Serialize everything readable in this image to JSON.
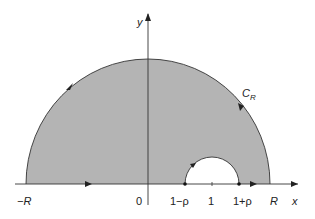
{
  "diagram": {
    "type": "contour",
    "colors": {
      "region_fill": "#b4b4b4",
      "line": "#333333",
      "background": "#ffffff"
    },
    "axes": {
      "x_label": "x",
      "y_label": "y"
    },
    "contour_label": "C",
    "contour_subscript": "R",
    "x_ticks": [
      {
        "label": "−R",
        "italic": true
      },
      {
        "label": "0",
        "italic": false
      },
      {
        "label": "1−ρ",
        "italic": false
      },
      {
        "label": "1",
        "italic": false
      },
      {
        "label": "1+ρ",
        "italic": false
      },
      {
        "label": "R",
        "italic": true
      }
    ]
  }
}
